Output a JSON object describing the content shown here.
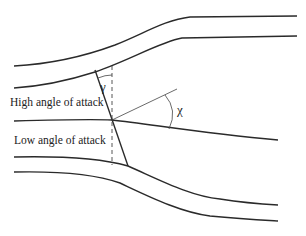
{
  "diagram": {
    "labels": {
      "high": "High angle of attack",
      "low": "Low angle of attack",
      "gamma": "γ",
      "chi": "χ"
    },
    "colors": {
      "stroke": "#2a2a2a",
      "background": "#ffffff"
    }
  }
}
